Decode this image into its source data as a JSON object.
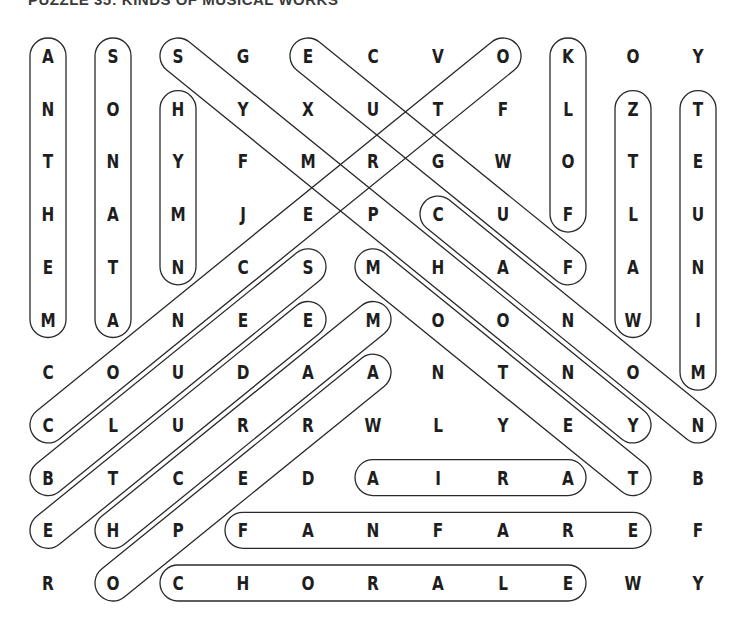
{
  "title": "PUZZLE 35: KINDS OF MUSICAL WORKS",
  "grid": {
    "rows": 11,
    "cols": 11,
    "letters": [
      [
        "A",
        "S",
        "S",
        "G",
        "E",
        "C",
        "V",
        "O",
        "K",
        "O",
        "Y"
      ],
      [
        "N",
        "O",
        "H",
        "Y",
        "X",
        "U",
        "T",
        "F",
        "L",
        "Z",
        "T"
      ],
      [
        "T",
        "N",
        "Y",
        "F",
        "M",
        "R",
        "G",
        "W",
        "O",
        "T",
        "E"
      ],
      [
        "H",
        "A",
        "M",
        "J",
        "E",
        "P",
        "C",
        "U",
        "F",
        "L",
        "U"
      ],
      [
        "E",
        "T",
        "N",
        "C",
        "S",
        "M",
        "H",
        "A",
        "F",
        "A",
        "N"
      ],
      [
        "M",
        "A",
        "N",
        "E",
        "E",
        "M",
        "O",
        "O",
        "N",
        "W",
        "I"
      ],
      [
        "C",
        "O",
        "U",
        "D",
        "A",
        "A",
        "N",
        "T",
        "N",
        "O",
        "M"
      ],
      [
        "C",
        "L",
        "U",
        "R",
        "R",
        "W",
        "L",
        "Y",
        "E",
        "Y",
        "N"
      ],
      [
        "B",
        "T",
        "C",
        "E",
        "D",
        "A",
        "I",
        "R",
        "A",
        "T",
        "B"
      ],
      [
        "E",
        "H",
        "P",
        "F",
        "A",
        "N",
        "F",
        "A",
        "R",
        "E",
        "F"
      ],
      [
        "R",
        "O",
        "C",
        "H",
        "O",
        "R",
        "A",
        "L",
        "E",
        "W",
        "Y"
      ]
    ]
  },
  "found_words": [
    {
      "word": "ANTHEM",
      "start": [
        0,
        0
      ],
      "end": [
        5,
        0
      ]
    },
    {
      "word": "SONATA",
      "start": [
        0,
        1
      ],
      "end": [
        5,
        1
      ]
    },
    {
      "word": "HYMN",
      "start": [
        1,
        2
      ],
      "end": [
        4,
        2
      ]
    },
    {
      "word": "FOLK",
      "start": [
        3,
        8
      ],
      "end": [
        0,
        8
      ]
    },
    {
      "word": "WALTZ",
      "start": [
        5,
        9
      ],
      "end": [
        1,
        9
      ]
    },
    {
      "word": "MINUET",
      "start": [
        6,
        10
      ],
      "end": [
        1,
        10
      ]
    },
    {
      "word": "SYMPHONY",
      "start": [
        0,
        2
      ],
      "end": [
        7,
        9
      ]
    },
    {
      "word": "FUGUE",
      "start": [
        4,
        8
      ],
      "end": [
        0,
        4
      ]
    },
    {
      "word": "CONCERTO",
      "start": [
        7,
        0
      ],
      "end": [
        0,
        7
      ]
    },
    {
      "word": "CANON",
      "start": [
        3,
        6
      ],
      "end": [
        7,
        10
      ]
    },
    {
      "word": "MOTET",
      "start": [
        4,
        5
      ],
      "end": [
        8,
        9
      ]
    },
    {
      "word": "BLUES",
      "start": [
        8,
        0
      ],
      "end": [
        4,
        4
      ]
    },
    {
      "word": "ETUDE",
      "start": [
        9,
        0
      ],
      "end": [
        5,
        4
      ]
    },
    {
      "word": "MARCH",
      "start": [
        5,
        5
      ],
      "end": [
        9,
        1
      ]
    },
    {
      "word": "OPERA",
      "start": [
        10,
        1
      ],
      "end": [
        6,
        5
      ]
    },
    {
      "word": "ARIA",
      "start": [
        8,
        8
      ],
      "end": [
        8,
        5
      ]
    },
    {
      "word": "FANFARE",
      "start": [
        9,
        3
      ],
      "end": [
        9,
        9
      ]
    },
    {
      "word": "CHORALE",
      "start": [
        10,
        2
      ],
      "end": [
        10,
        8
      ]
    }
  ],
  "colors": {
    "background": "#ffffff",
    "letters": "#1e1e1e",
    "loops": "#2a2a2a"
  }
}
